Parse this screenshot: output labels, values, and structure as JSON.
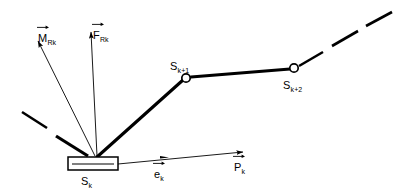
{
  "figure": {
    "type": "technical-line-diagram",
    "background_color": "#ffffff",
    "stroke_color": "#000000"
  },
  "labels": {
    "moment_vector": {
      "symbol": "M",
      "subscript": "Rk",
      "accent": "vector-arrow"
    },
    "force_vector": {
      "symbol": "F",
      "subscript": "Rk",
      "accent": "vector-arrow"
    },
    "joint_1": {
      "symbol": "S",
      "subscript": "k+1",
      "accent": "none"
    },
    "joint_2": {
      "symbol": "S",
      "subscript": "k+2",
      "accent": "none"
    },
    "base_segment": {
      "symbol": "S",
      "subscript": "k",
      "accent": "none"
    },
    "unit_vector": {
      "symbol": "e",
      "subscript": "k",
      "accent": "vector-arrow"
    },
    "position_vector": {
      "symbol": "P",
      "subscript": "k",
      "accent": "vector-arrow"
    }
  },
  "geometry": {
    "base_block": {
      "x": 68,
      "y": 157,
      "width": 50,
      "height": 13,
      "inner_line_y": 164
    },
    "attachment_point": {
      "x": 97,
      "y": 157
    },
    "joint_1_node": {
      "cx": 186,
      "cy": 78,
      "r": 4.2
    },
    "joint_2_node": {
      "cx": 294,
      "cy": 68,
      "r": 4.2
    },
    "link_base_to_joint1": {
      "x1": 97,
      "y1": 157,
      "x2": 183,
      "y2": 80
    },
    "link_joint1_to_joint2": {
      "x1": 191,
      "y1": 77,
      "x2": 290,
      "y2": 69
    },
    "moment_arrow": {
      "x1": 95,
      "y1": 156,
      "x2": 37,
      "y2": 40
    },
    "force_arrow": {
      "x1": 97,
      "y1": 156,
      "x2": 91,
      "y2": 31
    },
    "axis_arrow": {
      "x1": 118,
      "y1": 164,
      "x2": 245,
      "y2": 152,
      "mid_arrow_x": 166
    },
    "dashes_left": [
      {
        "x1": 22,
        "y1": 112,
        "x2": 47,
        "y2": 128
      },
      {
        "x1": 56,
        "y1": 136,
        "x2": 86,
        "y2": 155
      }
    ],
    "dashes_right": [
      {
        "x1": 299,
        "y1": 66,
        "x2": 323,
        "y2": 52
      },
      {
        "x1": 332,
        "y1": 46,
        "x2": 358,
        "y2": 31
      },
      {
        "x1": 366,
        "y1": 26,
        "x2": 392,
        "y2": 12
      }
    ]
  }
}
